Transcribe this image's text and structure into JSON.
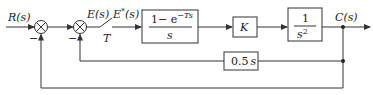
{
  "diagram": {
    "type": "control-system-block-diagram",
    "signals": {
      "input": "R(s)",
      "error": "E(s)",
      "sampled_error": "E*(s)",
      "output": "C(s)"
    },
    "sampler": {
      "period_label": "T"
    },
    "summers": [
      {
        "id": "summer-1",
        "inputs": [
          "+",
          "-"
        ],
        "minus_label": "−"
      },
      {
        "id": "summer-2",
        "inputs": [
          "+",
          "-"
        ],
        "minus_label": "−"
      }
    ],
    "blocks": {
      "zoh": {
        "numerator": "1− e",
        "exponent": "−Ts",
        "denominator": "s"
      },
      "gain": {
        "label": "K"
      },
      "plant": {
        "numerator": "1",
        "denominator": "s",
        "exponent": "2"
      },
      "feedback_inner": {
        "num": "0.5",
        "var": "s"
      }
    },
    "feedback_paths": [
      {
        "from": "C(s)",
        "through": "0.5s",
        "to": "summer-2"
      },
      {
        "from": "C(s)",
        "through": "unity",
        "to": "summer-1"
      }
    ],
    "colors": {
      "stroke": "#333333",
      "text": "#222222",
      "background": "#ffffff"
    }
  }
}
